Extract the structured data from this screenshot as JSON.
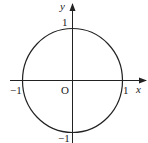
{
  "diagram": {
    "type": "unit-circle",
    "axes": {
      "x_label": "x",
      "y_label": "y",
      "origin_label": "O"
    },
    "ticks": {
      "x_pos": "1",
      "x_neg": "−1",
      "y_pos": "1",
      "y_neg": "−1"
    },
    "colors": {
      "stroke": "#222222",
      "background": "#ffffff"
    }
  }
}
